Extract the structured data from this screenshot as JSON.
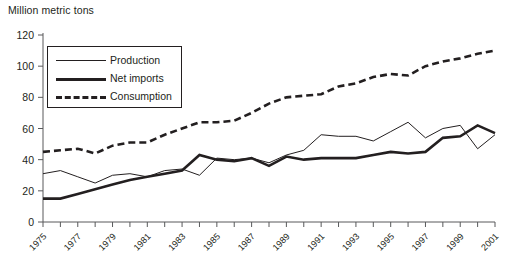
{
  "chart_data": {
    "type": "line",
    "title": "Million metric tons",
    "xlabel": "",
    "ylabel": "Million metric tons",
    "ylim": [
      0,
      120
    ],
    "ytick_values": [
      0,
      20,
      40,
      60,
      80,
      100,
      120
    ],
    "ytick_labels": [
      "0",
      "20",
      "40",
      "60",
      "80",
      "100",
      "120"
    ],
    "xlim": [
      1975,
      2001
    ],
    "x": [
      1975,
      1976,
      1977,
      1978,
      1979,
      1980,
      1981,
      1982,
      1983,
      1984,
      1985,
      1986,
      1987,
      1988,
      1989,
      1990,
      1991,
      1992,
      1993,
      1994,
      1995,
      1996,
      1997,
      1998,
      1999,
      2000,
      2001
    ],
    "xtick_labels": [
      "1975",
      "1977",
      "1979",
      "1981",
      "1983",
      "1985",
      "1987",
      "1989",
      "1991",
      "1993",
      "1995",
      "1997",
      "1999",
      "2001"
    ],
    "xtick_years": [
      1975,
      1977,
      1979,
      1981,
      1983,
      1985,
      1987,
      1989,
      1991,
      1993,
      1995,
      1997,
      1999,
      2001
    ],
    "grid": false,
    "legend_position": "upper-left-inside",
    "series": [
      {
        "name": "Production",
        "style": "thin-solid",
        "values": [
          31,
          33,
          29,
          25,
          30,
          31,
          29,
          33,
          34,
          30,
          41,
          40,
          41,
          38,
          43,
          46,
          56,
          55,
          55,
          52,
          58,
          64,
          54,
          60,
          62,
          47,
          56
        ]
      },
      {
        "name": "Net imports",
        "style": "thick-solid",
        "values": [
          15,
          15,
          18,
          21,
          24,
          27,
          29,
          31,
          33,
          43,
          40,
          39,
          41,
          36,
          42,
          40,
          41,
          41,
          41,
          43,
          45,
          44,
          45,
          54,
          55,
          62,
          57
        ]
      },
      {
        "name": "Consumption",
        "style": "dashed",
        "values": [
          45,
          46,
          47,
          44,
          49,
          51,
          51,
          56,
          60,
          64,
          64,
          65,
          70,
          76,
          80,
          81,
          82,
          87,
          89,
          93,
          95,
          94,
          100,
          103,
          105,
          108,
          110
        ]
      }
    ]
  },
  "legend": {
    "items": [
      {
        "label": "Production",
        "swatch": "thin-line-swatch"
      },
      {
        "label": "Net imports",
        "swatch": "thick-line-swatch"
      },
      {
        "label": "Consumption",
        "swatch": "dashed-line-swatch"
      }
    ]
  }
}
